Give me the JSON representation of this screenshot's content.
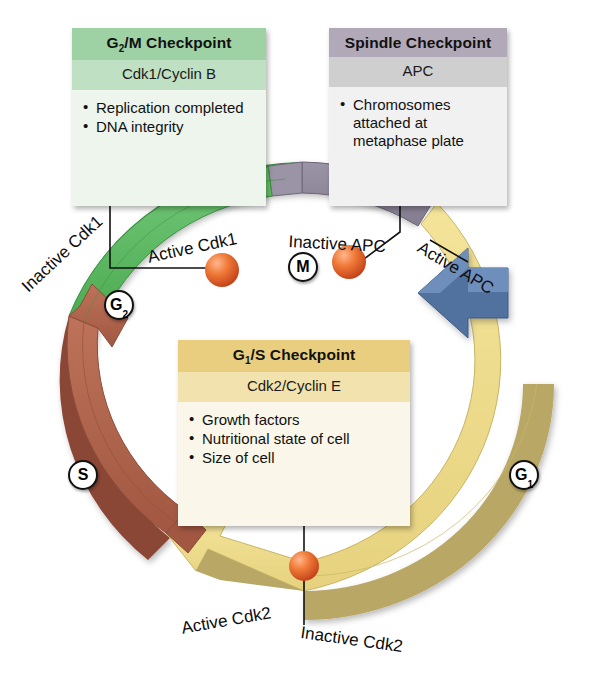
{
  "diagram": {
    "background": "#ffffff"
  },
  "checkpoints": [
    {
      "id": "g2m",
      "header": "G₂/M Checkpoint",
      "header_plain": "G2/M Checkpoint",
      "subtitle": "Cdk1/Cyclin B",
      "items": [
        "Replication completed",
        "DNA integrity"
      ],
      "header_color": "#9ed2a5",
      "subtitle_color": "#bfe0c2",
      "body_color": "#edf5ed"
    },
    {
      "id": "spindle",
      "header": "Spindle Checkpoint",
      "header_plain": "Spindle Checkpoint",
      "subtitle": "APC",
      "items": [
        "Chromosomes attached at metaphase plate"
      ],
      "header_color": "#b2a9b8",
      "subtitle_color": "#cfcfcf",
      "body_color": "#f1f1f1"
    },
    {
      "id": "g1s",
      "header": "G₁/S Checkpoint",
      "header_plain": "G1/S Checkpoint",
      "subtitle": "Cdk2/Cyclin E",
      "items": [
        "Growth factors",
        "Nutritional state of cell",
        "Size of cell"
      ],
      "header_color": "#e8ce7e",
      "subtitle_color": "#f2e3ae",
      "body_color": "#faf7ea"
    }
  ],
  "arc_labels": {
    "inactive_cdk1": "Inactive Cdk1",
    "active_cdk1": "Active Cdk1",
    "inactive_apc": "Inactive APC",
    "active_apc": "Active APC",
    "active_cdk2": "Active Cdk2",
    "inactive_cdk2": "Inactive Cdk2"
  },
  "phases": [
    {
      "id": "g1",
      "label": "G",
      "sub": "1",
      "name": "G1 phase",
      "color": "#ecd98a"
    },
    {
      "id": "s",
      "label": "S",
      "sub": "",
      "name": "S phase",
      "color": "#ad6049"
    },
    {
      "id": "g2",
      "label": "G",
      "sub": "2",
      "name": "G2 phase",
      "color": "#57b457"
    },
    {
      "id": "m",
      "label": "M",
      "sub": "",
      "name": "M phase",
      "color": "#8d8597"
    }
  ],
  "markers": {
    "sphere_color": "#e8622e",
    "sphere_count": 3,
    "names": [
      "g2m-checkpoint-marker",
      "spindle-checkpoint-marker",
      "g1s-checkpoint-marker"
    ]
  },
  "apc_arrow": {
    "name": "active-apc-arrow",
    "color": "#51719f"
  }
}
